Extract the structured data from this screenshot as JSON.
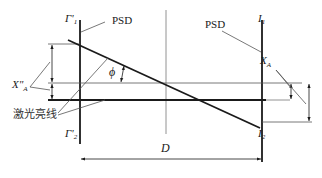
{
  "diagram": {
    "title": "",
    "labels": {
      "psd_left": "PSD",
      "psd_right": "PSD",
      "gamma1_prime": "Γ'",
      "gamma1_prime_sub": "1",
      "gamma2_prime": "Γ'",
      "gamma2_prime_sub": "2",
      "i1": "I",
      "i1_sub": "1",
      "i2": "I",
      "i2_sub": "2",
      "phi": "ϕ",
      "xa_prime": "X\"",
      "xa_prime_sub": "A",
      "xa": "X",
      "xa_sub": "A",
      "laser_line": "激光亮线",
      "distance": "D"
    },
    "colors": {
      "line": "#1a1a1a",
      "thin_line": "#555555",
      "background": "#ffffff"
    },
    "elements": [
      "left PSD detector (vertical line Γ'1–Γ'2)",
      "right PSD detector (vertical line I1–I2)",
      "center reference line",
      "tilted laser line at angle ϕ",
      "horizontal laser bright line",
      "dimension X\"A on left",
      "dimension XA on right",
      "distance D between detectors"
    ]
  }
}
